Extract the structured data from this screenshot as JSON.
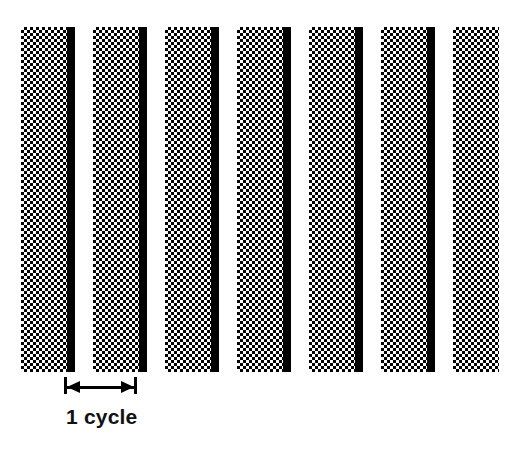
{
  "figure": {
    "background_color": "#ffffff",
    "width": 510,
    "height": 461
  },
  "grating": {
    "bar_count": 7,
    "cycle_width_px": 72,
    "bars_top_px": 27,
    "bars_bottom_px": 372,
    "gray_bar": {
      "fill": "halftone-checkerboard-50",
      "color": "#000000",
      "background": "#ffffff",
      "cell_size_px": 3,
      "width_px": 46
    },
    "black_bar": {
      "color": "#000000",
      "width_px": 8
    },
    "white_gap": {
      "color": "#ffffff",
      "width_px": 18
    },
    "bars": [
      {
        "index": 1,
        "gray_left": 21,
        "gray_width": 46,
        "black_left": 67,
        "black_width": 8
      },
      {
        "index": 2,
        "gray_left": 93,
        "gray_width": 46,
        "black_left": 139,
        "black_width": 8
      },
      {
        "index": 3,
        "gray_left": 165,
        "gray_width": 46,
        "black_left": 211,
        "black_width": 8
      },
      {
        "index": 4,
        "gray_left": 237,
        "gray_width": 46,
        "black_left": 283,
        "black_width": 8
      },
      {
        "index": 5,
        "gray_left": 309,
        "gray_width": 46,
        "black_left": 355,
        "black_width": 8
      },
      {
        "index": 6,
        "gray_left": 381,
        "gray_width": 46,
        "black_left": 427,
        "black_width": 8
      },
      {
        "index": 7,
        "gray_left": 453,
        "gray_width": 46,
        "black_left": 0,
        "black_width": 0
      }
    ]
  },
  "annotation": {
    "label": "1 cycle",
    "label_left_px": 66,
    "label_top_px": 406,
    "measure_left_px": 64,
    "measure_right_px": 137,
    "measure_span_px": 73,
    "tick_top_px": 377,
    "tick_height_px": 17,
    "arrow_y_px": 386,
    "color": "#000000"
  }
}
